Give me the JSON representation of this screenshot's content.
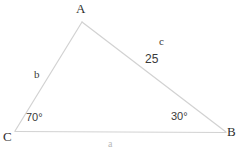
{
  "diagram": {
    "type": "triangle-geometry-diagram",
    "stroke_color": "#d2d2d2",
    "text_color": "#3a3a3a",
    "background_color": "#ffffff",
    "vertices": [
      {
        "name": "A",
        "label": "A",
        "x": 82,
        "y": 22
      },
      {
        "name": "B",
        "label": "B",
        "x": 226,
        "y": 132
      },
      {
        "name": "C",
        "label": "C",
        "x": 15,
        "y": 131
      }
    ],
    "sides": [
      {
        "name": "a",
        "label": "a",
        "opposite_vertex": "A",
        "from": "C",
        "to": "B"
      },
      {
        "name": "b",
        "label": "b",
        "opposite_vertex": "B",
        "from": "C",
        "to": "A"
      },
      {
        "name": "c",
        "label": "c",
        "opposite_vertex": "C",
        "from": "A",
        "to": "B",
        "measure": "25"
      }
    ],
    "angles": [
      {
        "at_vertex": "C",
        "label": "70°",
        "value": 70
      },
      {
        "at_vertex": "B",
        "label": "30°",
        "value": 30
      }
    ],
    "measures": [
      {
        "side": "c",
        "label": "25",
        "value": 25
      }
    ]
  }
}
